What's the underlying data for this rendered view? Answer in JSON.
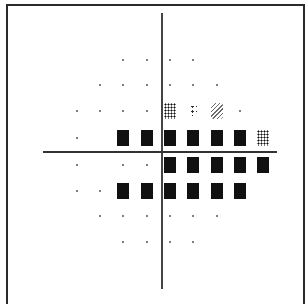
{
  "figure": {
    "type": "visual-field-grayscale-plot",
    "columns_x": [
      77,
      100,
      123,
      147,
      170,
      193,
      217,
      240,
      263
    ],
    "rows_y": [
      60,
      85,
      111,
      138,
      165,
      191,
      216,
      242
    ],
    "legend_symbols": {
      "dot": "normal sensitivity",
      "sparse": "light loss",
      "hatch": "moderate loss",
      "dense": "marked loss",
      "solid": "absolute defect"
    },
    "grid": [
      [
        "",
        "",
        "dot",
        "dot",
        "dot",
        "dot",
        "",
        "",
        ""
      ],
      [
        "",
        "dot",
        "dot",
        "dot",
        "dot",
        "dot",
        "dot",
        "",
        ""
      ],
      [
        "dot",
        "dot",
        "dot",
        "dot",
        "dense",
        "sparse",
        "hatch",
        "dot",
        ""
      ],
      [
        "dot",
        "",
        "solid",
        "solid",
        "solid",
        "solid",
        "solid",
        "solid",
        "dense"
      ],
      [
        "dot",
        "",
        "dot",
        "dot",
        "solid",
        "solid",
        "solid",
        "solid",
        "solid"
      ],
      [
        "dot",
        "dot",
        "solid",
        "solid",
        "solid",
        "solid",
        "solid",
        "solid",
        ""
      ],
      [
        "",
        "dot",
        "dot",
        "dot",
        "dot",
        "dot",
        "dot",
        "",
        ""
      ],
      [
        "",
        "",
        "dot",
        "dot",
        "dot",
        "dot",
        "",
        "",
        ""
      ]
    ]
  }
}
